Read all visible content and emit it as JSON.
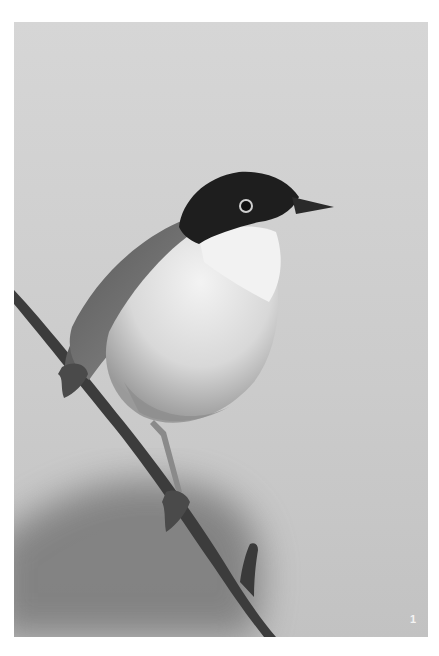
{
  "photo": {
    "subject": "Small perching bird (warbler) on a twig",
    "style": "black-and-white photograph",
    "colors": {
      "background_light": "#d9d9d9",
      "background_mid": "#c4c4c4",
      "shadow": "#7a7a7a",
      "cap": "#1c1c1c",
      "throat": "#f2f2f2",
      "breast": "#cfcfcf",
      "back": "#6e6e6e",
      "branch": "#3a3a3a"
    }
  },
  "plate_number": "1"
}
